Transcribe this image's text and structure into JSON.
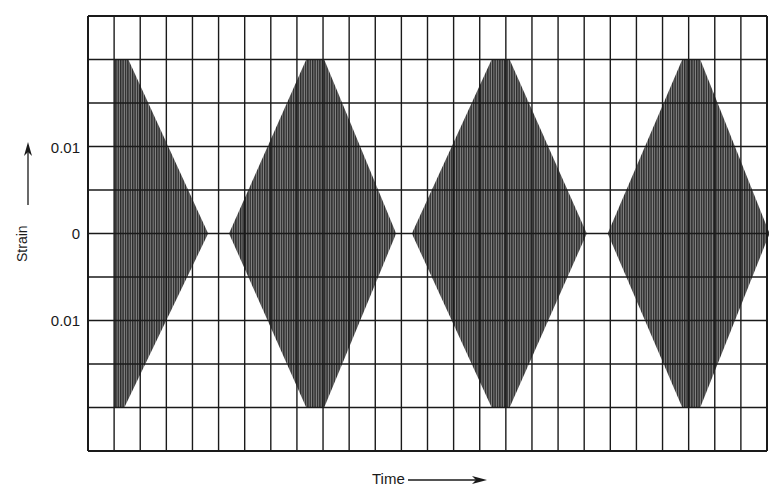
{
  "chart_data": {
    "type": "area",
    "title": "",
    "xlabel": "Time",
    "ylabel": "Strain",
    "y_tick_labels": [
      {
        "value": 0.01,
        "label": "0.01"
      },
      {
        "value": 0,
        "label": "0"
      },
      {
        "value": -0.01,
        "label": "0.01"
      }
    ],
    "ylim": [
      -0.025,
      0.025
    ],
    "grid": true,
    "grid_columns": 26,
    "grid_rows": 10,
    "row_step_strain": 0.005,
    "x_units": "grid columns (no numeric labels shown)",
    "series": [
      {
        "name": "strain envelope",
        "envelopes": [
          {
            "start": 1.0,
            "peak": 1.2,
            "end": 4.6,
            "amplitude": 0.02,
            "truncated_left": true
          },
          {
            "start": 5.4,
            "peak": 8.7,
            "end": 11.8,
            "amplitude": 0.02
          },
          {
            "start": 12.4,
            "peak": 15.8,
            "end": 19.1,
            "amplitude": 0.02
          },
          {
            "start": 19.9,
            "peak": 23.1,
            "end": 26.1,
            "amplitude": 0.02
          }
        ]
      }
    ],
    "legend": null
  },
  "labels": {
    "y_top": "0.01",
    "y_zero": "0",
    "y_bottom": "0.01",
    "y_axis": "Strain",
    "x_axis": "Time"
  },
  "colors": {
    "grid": "#1a1a1a",
    "fill": "#3a3a3a",
    "background": "#ffffff"
  }
}
